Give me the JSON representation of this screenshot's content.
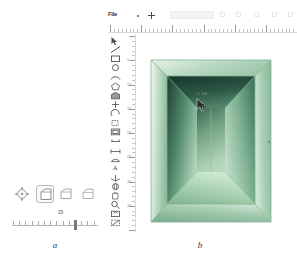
{
  "figure": {
    "panel_a_label": "a",
    "panel_b_label": "b"
  },
  "panel_a": {
    "tools": [
      {
        "name": "move-tool",
        "icon": "move-icon",
        "label": "",
        "selected": false
      },
      {
        "name": "box-shape-tool",
        "icon": "box-shape-icon",
        "label": "",
        "selected": true
      },
      {
        "name": "wedge-shape-tool",
        "icon": "wedge-shape-icon",
        "label": "",
        "selected": false
      },
      {
        "name": "ramp-shape-tool",
        "icon": "ramp-shape-icon",
        "label": "",
        "selected": false
      }
    ],
    "slider": {
      "value": "15",
      "ticks": 14
    }
  },
  "panel_b": {
    "topbar": {
      "menu_label": "File",
      "plus_icon": "plus-icon",
      "field_value": "",
      "field_placeholder": ""
    },
    "h_ruler": {
      "ticks": 48,
      "major_every": 8
    },
    "v_ruler": {
      "ticks": 40,
      "major_every": 5,
      "numbers": [
        "5",
        "10",
        "15",
        "20",
        "25",
        "30",
        "35"
      ]
    },
    "vertical_tools": [
      {
        "name": "select-arrow-tool",
        "icon": "arrow-icon"
      },
      {
        "name": "line-tool",
        "icon": "line-icon"
      },
      {
        "name": "rectangle-tool",
        "icon": "rectangle-icon"
      },
      {
        "name": "circle-tool",
        "icon": "circle-icon"
      },
      {
        "name": "arc-tool",
        "icon": "arc-icon"
      },
      {
        "name": "polygon-tool",
        "icon": "polygon-icon"
      },
      {
        "name": "pushpull-tool",
        "icon": "pushpull-icon"
      },
      {
        "name": "move-tool",
        "icon": "move-icon"
      },
      {
        "name": "rotate-tool",
        "icon": "rotate-icon"
      },
      {
        "name": "scale-tool",
        "icon": "scale-icon"
      },
      {
        "name": "offset-tool",
        "icon": "offset-icon"
      },
      {
        "name": "tape-measure-tool",
        "icon": "ruler-icon"
      },
      {
        "name": "dimension-tool",
        "icon": "dimension-icon"
      },
      {
        "name": "protractor-tool",
        "icon": "protractor-icon"
      },
      {
        "name": "text-tool",
        "icon": "text-icon"
      },
      {
        "name": "axes-tool",
        "icon": "axes-icon"
      },
      {
        "name": "orbit-tool",
        "icon": "orbit-icon"
      },
      {
        "name": "pan-tool",
        "icon": "pan-icon"
      },
      {
        "name": "zoom-tool",
        "icon": "zoom-icon"
      },
      {
        "name": "zoom-extents-tool",
        "icon": "zoom-extents-icon"
      },
      {
        "name": "section-plane-tool",
        "icon": "section-icon"
      }
    ],
    "canvas": {
      "cursor_readout": "0, 108",
      "model_name": "green-box-interior"
    }
  },
  "colors": {
    "box_outer_light": "#d6e8dc",
    "box_outer_mid": "#9cc4aa",
    "box_frame": "#7fb492",
    "box_interior_dark": "#1f3f32",
    "box_interior_light": "#bcdcc2",
    "box_edge": "#6aa07f",
    "ruler_line": "#d8d8d8",
    "tick": "#c4c4c4",
    "text": "#333333"
  }
}
